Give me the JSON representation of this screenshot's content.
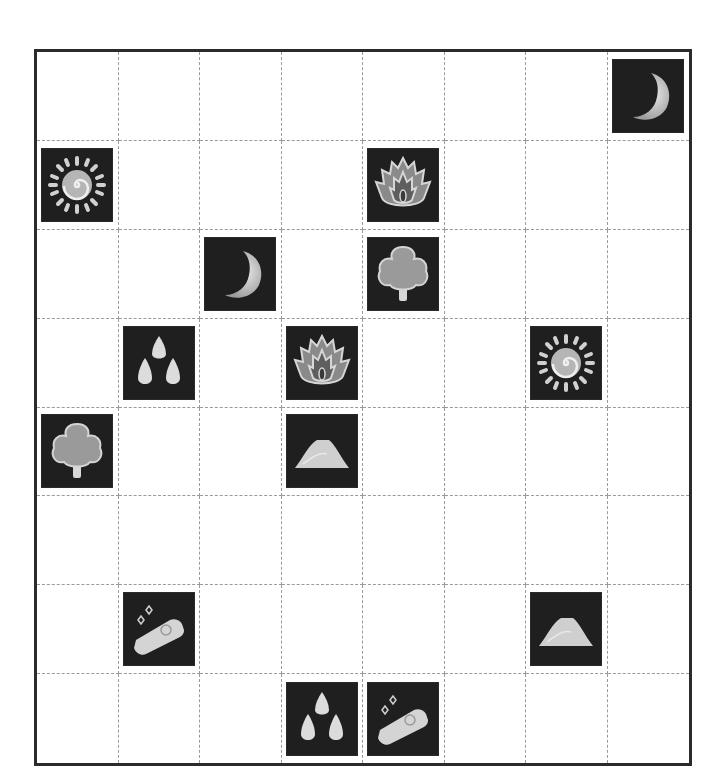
{
  "board": {
    "rows": 8,
    "cols": 8,
    "colors": {
      "tile_background": "#1f1f1f",
      "icon_light": "#d9d9d9",
      "icon_mid": "#a8a8a8",
      "grid_line": "#9a9a9a",
      "border": "#2b2b2b"
    },
    "pieces": [
      {
        "row": 0,
        "col": 7,
        "icon": "moon"
      },
      {
        "row": 1,
        "col": 0,
        "icon": "sun"
      },
      {
        "row": 1,
        "col": 4,
        "icon": "fire"
      },
      {
        "row": 2,
        "col": 2,
        "icon": "moon"
      },
      {
        "row": 2,
        "col": 4,
        "icon": "tree"
      },
      {
        "row": 3,
        "col": 1,
        "icon": "water-drops"
      },
      {
        "row": 3,
        "col": 3,
        "icon": "fire"
      },
      {
        "row": 3,
        "col": 6,
        "icon": "sun"
      },
      {
        "row": 4,
        "col": 0,
        "icon": "tree"
      },
      {
        "row": 4,
        "col": 3,
        "icon": "sand-pile"
      },
      {
        "row": 6,
        "col": 1,
        "icon": "gold-bar"
      },
      {
        "row": 6,
        "col": 6,
        "icon": "sand-pile"
      },
      {
        "row": 7,
        "col": 3,
        "icon": "water-drops"
      },
      {
        "row": 7,
        "col": 4,
        "icon": "gold-bar"
      }
    ]
  }
}
